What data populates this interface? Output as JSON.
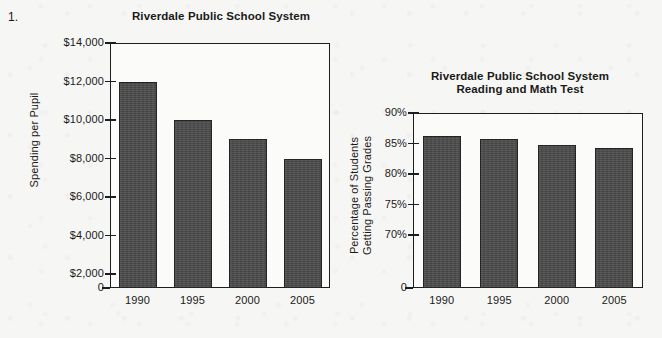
{
  "page": {
    "question_number": "1.",
    "background_color": "#f6f6f4",
    "ink_color": "#1d1d1d",
    "bar_color": "#4b4b4b"
  },
  "chart_data": [
    {
      "id": "spending",
      "type": "bar",
      "title": "Riverdale Public School System",
      "xlabel": "",
      "ylabel": "Spending per Pupil",
      "categories": [
        "1990",
        "1995",
        "2000",
        "2005"
      ],
      "values": [
        12000,
        10000,
        9000,
        8000
      ],
      "ytick_labels": [
        "$14,000",
        "$12,000",
        "$10,000",
        "$8,000",
        "$6,000",
        "$4,000",
        "$2,000",
        "0"
      ],
      "ytick_values": [
        14000,
        12000,
        10000,
        8000,
        6000,
        4000,
        2000,
        0
      ],
      "ylim": [
        0,
        14000
      ],
      "grid": false,
      "legend": "none",
      "axis_break": false
    },
    {
      "id": "passing-grades",
      "type": "bar",
      "title": "Riverdale Public School System\nReading and Math Test",
      "xlabel": "",
      "ylabel": "Percentage of Students\nGetting Passing Grades",
      "categories": [
        "1990",
        "1995",
        "2000",
        "2005"
      ],
      "values": [
        86.3,
        85.7,
        84.8,
        84.2
      ],
      "ytick_labels": [
        "90%",
        "85%",
        "80%",
        "75%",
        "70%",
        "0"
      ],
      "ytick_values": [
        90,
        85,
        80,
        75,
        70,
        0
      ],
      "ylim": [
        68,
        90
      ],
      "grid": false,
      "legend": "none",
      "axis_break": true
    }
  ]
}
